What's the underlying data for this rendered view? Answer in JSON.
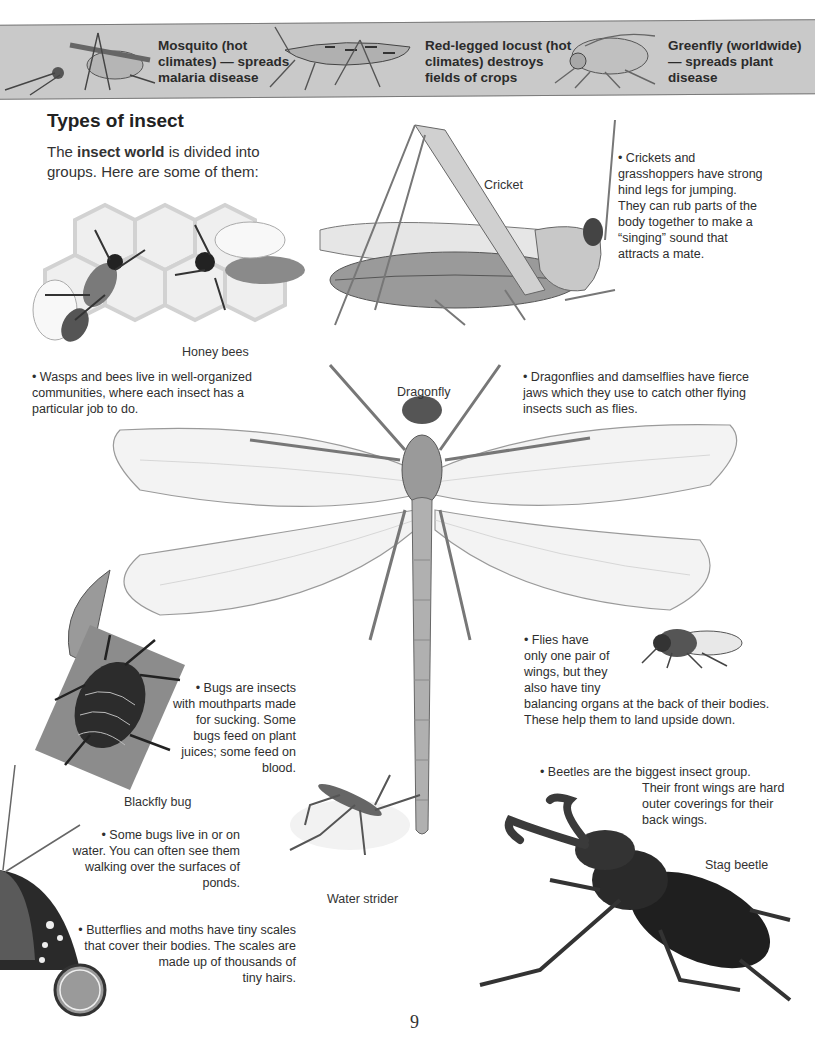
{
  "top_strip": {
    "items": [
      {
        "text_lines": [
          "Mosquito (hot",
          "climates) — spreads",
          "malaria disease"
        ]
      },
      {
        "text_lines": [
          "Red-legged locust (hot",
          "climates) destroys",
          "fields of crops"
        ]
      },
      {
        "text_lines": [
          "Greenfly (worldwide)",
          "— spreads plant",
          "disease"
        ]
      }
    ]
  },
  "heading": "Types of insect",
  "intro": {
    "before": "The ",
    "bold": "insect world",
    "after": " is divided into groups. Here are some of them:"
  },
  "captions": {
    "cricket": "Cricket",
    "honey_bees": "Honey bees",
    "dragonfly": "Dragonfly",
    "blackfly_bug": "Blackfly bug",
    "water_strider": "Water strider",
    "stag_beetle": "Stag beetle"
  },
  "facts": {
    "crickets": [
      "• Crickets and",
      "grasshoppers have strong",
      "hind legs for jumping.",
      "They can rub parts of the",
      "body together to make a",
      "“singing” sound that",
      "attracts a mate."
    ],
    "wasps": [
      "• Wasps and bees live in well-organized",
      "communities, where each insect has a",
      "particular job to do."
    ],
    "dragonflies": [
      "• Dragonflies and damselflies have fierce",
      "jaws which they use to catch other flying",
      "insects such as flies."
    ],
    "flies": [
      "• Flies have",
      "only one pair of",
      "wings, but they",
      "also have tiny",
      "balancing organs at the back of their bodies.",
      "These help them to land upside down."
    ],
    "bugs": [
      "• Bugs are insects",
      "with mouthparts made",
      "for sucking. Some",
      "bugs feed on plant",
      "juices; some feed on",
      "blood."
    ],
    "beetles": [
      "• Beetles are the biggest insect group.",
      "Their front wings are hard",
      "outer coverings for their",
      "back wings."
    ],
    "water_bugs": [
      "• Some bugs live in or on",
      "water. You can often see them",
      "walking over the surfaces of",
      "ponds."
    ],
    "butterflies": [
      "• Butterflies and moths have tiny scales",
      "that cover their bodies. The scales are",
      "made up of thousands of",
      "tiny hairs."
    ]
  },
  "page_number": "9"
}
